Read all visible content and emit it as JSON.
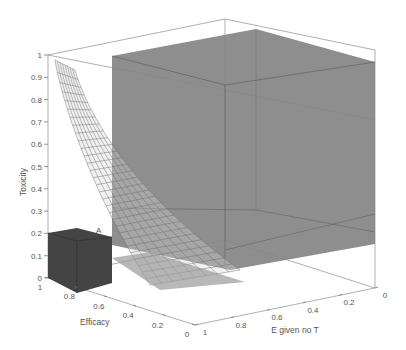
{
  "chart_data": {
    "type": "surface3d",
    "title": "",
    "axes": {
      "z": {
        "label": "Toxicity",
        "range": [
          0,
          1
        ],
        "ticks": [
          "0",
          "0.1",
          "0.2",
          "0.3",
          "0.4",
          "0.5",
          "0.6",
          "0.7",
          "0.8",
          "0.9",
          "1"
        ]
      },
      "efficacy": {
        "label": "Efficacy",
        "range": [
          0,
          1
        ],
        "ticks": [
          "1",
          "0.8",
          "0.6",
          "0.4",
          "0.2",
          "0"
        ]
      },
      "e_given_no_t": {
        "label": "E given no T",
        "range": [
          0,
          1
        ],
        "ticks": [
          "1",
          "0.8",
          "0.6",
          "0.4",
          "0.2",
          "0"
        ]
      }
    },
    "annotations": [
      {
        "text": "A",
        "position": "top-right corner of small dark cube near Efficacy=1, E given no T=1, Toxicity=0.2"
      }
    ],
    "objects": [
      {
        "name": "small-region-cube",
        "kind": "box",
        "color": "#3f3f3f",
        "toxicity_max": 0.2,
        "description": "dark cube at high efficacy, toxicity <= 0.2"
      },
      {
        "name": "large-region-cube",
        "kind": "box",
        "color": "#7d7d7d",
        "toxicity_range": [
          0.15,
          1.0
        ],
        "description": "large translucent gray box toward E given no T low"
      },
      {
        "name": "boundary-surface",
        "kind": "mesh",
        "color": "#888888",
        "description": "wireframe surface decaying from toxicity ~0.97 to ~0 as efficacy falls"
      }
    ],
    "grid": false,
    "legend": null
  },
  "colors": {
    "small_cube": "#3e3e3e",
    "large_cube": "#808080",
    "mesh": "#6a6a6a",
    "axis": "#9a9a9a"
  }
}
